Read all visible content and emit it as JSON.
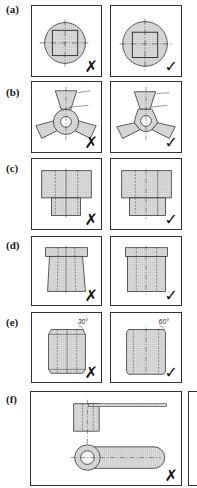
{
  "figure": {
    "rows": [
      {
        "label": "(a)",
        "topic": "circle-with-square-section",
        "left": {
          "mark": "✗",
          "verdict": "incorrect"
        },
        "right": {
          "mark": "✓",
          "verdict": "correct"
        }
      },
      {
        "label": "(b)",
        "topic": "three-arm-spider-section",
        "left": {
          "mark": "✗",
          "verdict": "incorrect"
        },
        "right": {
          "mark": "✓",
          "verdict": "correct"
        }
      },
      {
        "label": "(c)",
        "topic": "stepped-block-section",
        "left": {
          "mark": "✗",
          "verdict": "incorrect"
        },
        "right": {
          "mark": "✓",
          "verdict": "correct"
        }
      },
      {
        "label": "(d)",
        "topic": "flanged-cylinder-section",
        "left": {
          "mark": "✗",
          "verdict": "incorrect"
        },
        "right": {
          "mark": "✓",
          "verdict": "correct"
        }
      },
      {
        "label": "(e)",
        "topic": "chamfered-cylinder-section",
        "left": {
          "mark": "✗",
          "verdict": "incorrect",
          "angle": "30°"
        },
        "right": {
          "mark": "✓",
          "verdict": "correct",
          "angle": "60°"
        }
      },
      {
        "label": "(f)",
        "topic": "lever-arm-two-view",
        "left": {
          "mark": "✗",
          "verdict": "incorrect"
        }
      }
    ]
  },
  "colors": {
    "line": "#222222",
    "hatch": "#d9d9d9",
    "paper": "#ffffff"
  }
}
